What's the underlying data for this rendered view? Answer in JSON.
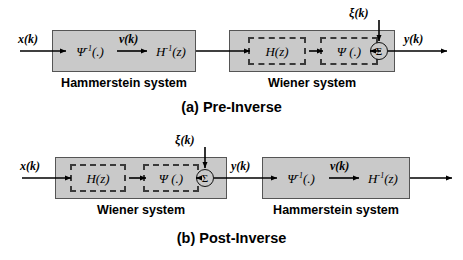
{
  "figure": {
    "title_a": "(a) Pre-Inverse",
    "title_b": "(b) Post-Inverse"
  },
  "labels": {
    "hammerstein": "Hammerstein system",
    "wiener": "Wiener system",
    "psi_inverse": "Ψ",
    "psi_inverse_sup": "-1",
    "psi_inverse_arg": "(.)",
    "psi": "Ψ (.)",
    "h_inverse": "H",
    "h_inverse_sup": "-1",
    "h_inverse_arg": "(z)",
    "hz": "H(z)",
    "sigma": "Σ"
  },
  "signals": {
    "x": "x(k)",
    "v": "v(k)",
    "y": "y(k)",
    "noise": "ξ(k)"
  },
  "panel_a": {
    "name": "Pre-Inverse",
    "order": [
      "Hammerstein system",
      "Wiener system"
    ],
    "blocks": [
      {
        "system": "Hammerstein system",
        "stages": [
          "Ψ⁻¹(.)",
          "H⁻¹(z)"
        ],
        "dashed": false
      },
      {
        "system": "Wiener system",
        "stages": [
          "H(z)",
          "Ψ (.)"
        ],
        "dashed": true
      }
    ],
    "input": "x(k)",
    "intermediate": "v(k)",
    "output": "y(k)",
    "noise_input": "ξ(k)",
    "summer": "Σ"
  },
  "panel_b": {
    "name": "Post-Inverse",
    "order": [
      "Wiener system",
      "Hammerstein system"
    ],
    "blocks": [
      {
        "system": "Wiener system",
        "stages": [
          "H(z)",
          "Ψ (.)"
        ],
        "dashed": true
      },
      {
        "system": "Hammerstein system",
        "stages": [
          "Ψ⁻¹(.)",
          "H⁻¹(z)"
        ],
        "dashed": false
      }
    ],
    "input": "x(k)",
    "intermediate": "v(k)",
    "output": "y(k)",
    "noise_input": "ξ(k)",
    "summer": "Σ"
  },
  "colors": {
    "block_fill": "#c9c9c9",
    "block_stroke": "#555555",
    "dashed_stroke": "#3a3a3a",
    "wire": "#000000",
    "background": "#ffffff"
  }
}
